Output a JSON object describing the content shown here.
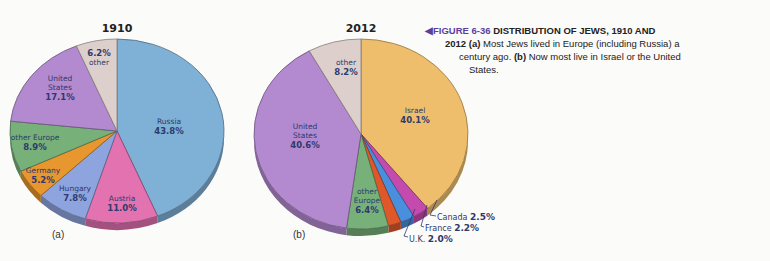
{
  "caption": {
    "arrow_icon": "◀",
    "figure_number": "FIGURE 6-36",
    "heading": "DISTRIBUTION OF JEWS, 1910 AND",
    "heading_cont": "2012",
    "part_a_marker": "(a)",
    "part_a_text": "Most Jews lived in Europe (including Russia) a",
    "part_a_text_cont": "century ago.",
    "part_b_marker": "(b)",
    "part_b_text": "Now most live in Israel or the United",
    "part_b_text_cont": "States.",
    "accent_color": "#5a3fa0"
  },
  "chart_data": [
    {
      "type": "pie",
      "title": "1910",
      "panel_label": "(a)",
      "categories": [
        "Russia",
        "Austria",
        "Hungary",
        "Germany",
        "other Europe",
        "United States",
        "other"
      ],
      "values": [
        43.8,
        11.0,
        7.8,
        5.2,
        8.9,
        17.1,
        6.2
      ],
      "labels": [
        "43.8%",
        "11.0%",
        "7.8%",
        "5.2%",
        "8.9%",
        "17.1%",
        "6.2%"
      ],
      "colors": [
        "#7fb0d6",
        "#e272b0",
        "#8ea4de",
        "#e8962e",
        "#78b07a",
        "#b389d0",
        "#ddd0cc"
      ],
      "start_angle": "12 o'clock",
      "direction": "clockwise",
      "unit": "%"
    },
    {
      "type": "pie",
      "title": "2012",
      "panel_label": "(b)",
      "categories": [
        "Israel",
        "Canada",
        "France",
        "U.K.",
        "other Europe",
        "United States",
        "other"
      ],
      "values": [
        40.1,
        2.5,
        2.2,
        2.0,
        6.4,
        40.6,
        8.2
      ],
      "labels": [
        "40.1%",
        "2.5%",
        "2.2%",
        "2.0%",
        "6.4%",
        "40.6%",
        "8.2%"
      ],
      "colors": [
        "#efbe6c",
        "#c54aae",
        "#4a8ede",
        "#e0582a",
        "#78b07a",
        "#b389d0",
        "#ddd0cc"
      ],
      "callouts": [
        "Canada",
        "France",
        "U.K."
      ],
      "start_angle": "12 o'clock",
      "direction": "clockwise",
      "unit": "%"
    }
  ],
  "pie_a": {
    "title": "1910",
    "panel": "(a)",
    "slices": [
      {
        "name": "Russia",
        "pct": "43.8%"
      },
      {
        "name": "Austria",
        "pct": "11.0%"
      },
      {
        "name": "Hungary",
        "pct": "7.8%"
      },
      {
        "name": "Germany",
        "pct": "5.2%"
      },
      {
        "name": "other Europe",
        "pct": "8.9%"
      },
      {
        "name_l1": "United",
        "name_l2": "States",
        "pct": "17.1%"
      },
      {
        "name": "other",
        "pct": "6.2%"
      }
    ]
  },
  "pie_b": {
    "title": "2012",
    "panel": "(b)",
    "slices": [
      {
        "name": "Israel",
        "pct": "40.1%"
      },
      {
        "name": "Canada",
        "pct": "2.5%"
      },
      {
        "name": "France",
        "pct": "2.2%"
      },
      {
        "name": "U.K.",
        "pct": "2.0%"
      },
      {
        "name_l1": "other",
        "name_l2": "Europe",
        "pct": "6.4%"
      },
      {
        "name_l1": "United",
        "name_l2": "States",
        "pct": "40.6%"
      },
      {
        "name": "other",
        "pct": "8.2%"
      }
    ]
  }
}
